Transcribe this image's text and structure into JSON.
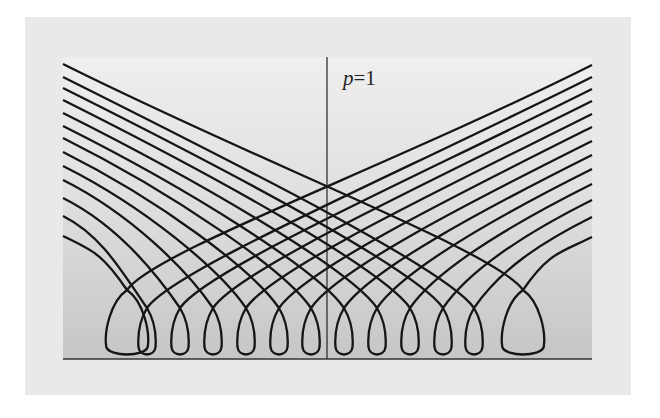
{
  "figure": {
    "label_var": "p",
    "label_eq": "=1",
    "colors": {
      "outer_bg": "#e9e9e9",
      "plot_top": "#efefef",
      "plot_bottom": "#c6c6c6",
      "curve": "#151515",
      "axis": "#222222"
    }
  },
  "plot": {
    "left": 63,
    "right": 592,
    "top": 57,
    "baseline": 359,
    "axis_x": 327
  },
  "curves": {
    "count": 13,
    "left_start_y": [
      64,
      77,
      88,
      100,
      113,
      126,
      138,
      152,
      166,
      180,
      198,
      216,
      236
    ],
    "right_end_y": [
      65,
      77,
      89,
      101,
      114,
      127,
      141,
      155,
      169,
      184,
      200,
      217,
      237
    ],
    "loop_centers_x": [
      127,
      147,
      180,
      213,
      246,
      279,
      311,
      344,
      377,
      410,
      443,
      474,
      523
    ],
    "loop_bottom_y": 357
  }
}
